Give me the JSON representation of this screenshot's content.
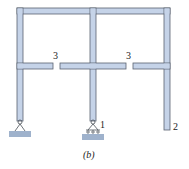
{
  "figure": {
    "caption": "(b)",
    "labels": {
      "hinge_left_beam": "3",
      "hinge_right_beam": "3",
      "support_middle": "1",
      "free_end_right": "2"
    },
    "colors": {
      "member_fill": "#c5d3e8",
      "member_stroke": "#5b6370",
      "ground_fill": "#9fb2cc",
      "text": "#222222"
    }
  }
}
